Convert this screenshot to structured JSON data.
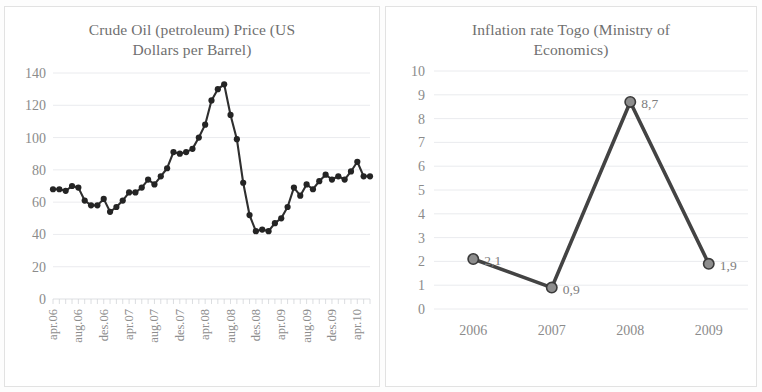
{
  "page": {
    "background": "#ffffff",
    "panel_border_color": "#e2e2e2"
  },
  "charts": [
    {
      "id": "crude-oil-price",
      "title_line1": "Crude Oil (petroleum) Price (US",
      "title_line2": "Dollars per Barrel)"
    },
    {
      "id": "inflation-togo",
      "title_line1": "Inflation rate Togo (Ministry of",
      "title_line2": "Economics)"
    }
  ],
  "chart_data": [
    {
      "type": "line",
      "id": "crude-oil-price",
      "title": "Crude Oil (petroleum) Price (US Dollars per Barrel)",
      "xlabel": "",
      "ylabel": "",
      "ylim": [
        0,
        140
      ],
      "yticks": [
        0,
        20,
        40,
        60,
        80,
        100,
        120,
        140
      ],
      "grid": true,
      "legend": "none",
      "markers": true,
      "line_color": "#2f2f2f",
      "marker_color": "#242424",
      "xtick_labels": [
        "apr.06",
        "aug.06",
        "des.06",
        "apr.07",
        "aug.07",
        "des.07",
        "apr.08",
        "aug.08",
        "des.08",
        "apr.09",
        "aug.09",
        "des.09",
        "apr.10"
      ],
      "xtick_label_rotation": -90,
      "x": [
        "apr.06",
        "may.06",
        "jun.06",
        "jul.06",
        "aug.06",
        "sep.06",
        "oct.06",
        "nov.06",
        "des.06",
        "jan.07",
        "feb.07",
        "mar.07",
        "apr.07",
        "may.07",
        "jun.07",
        "jul.07",
        "aug.07",
        "sep.07",
        "oct.07",
        "nov.07",
        "des.07",
        "jan.08",
        "feb.08",
        "mar.08",
        "apr.08",
        "may.08",
        "jun.08",
        "jul.08",
        "aug.08",
        "sep.08",
        "oct.08",
        "nov.08",
        "des.08",
        "jan.09",
        "feb.09",
        "mar.09",
        "apr.09",
        "may.09",
        "jun.09",
        "jul.09",
        "aug.09",
        "sep.09",
        "oct.09",
        "nov.09",
        "des.09",
        "jan.10",
        "feb.10",
        "mar.10",
        "apr.10"
      ],
      "values": [
        68,
        68,
        67,
        70,
        69,
        61,
        58,
        58,
        62,
        54,
        57,
        61,
        66,
        66,
        69,
        74,
        71,
        76,
        81,
        91,
        90,
        91,
        93,
        100,
        108,
        123,
        130,
        133,
        114,
        99,
        72,
        52,
        42,
        43,
        42,
        47,
        50,
        57,
        69,
        64,
        71,
        68,
        73,
        77,
        74,
        76,
        74,
        79,
        85,
        76,
        76
      ]
    },
    {
      "type": "line",
      "id": "inflation-togo",
      "title": "Inflation rate Togo (Ministry of Economics)",
      "xlabel": "",
      "ylabel": "",
      "ylim": [
        0,
        10
      ],
      "yticks": [
        0,
        1,
        2,
        3,
        4,
        5,
        6,
        7,
        8,
        9,
        10
      ],
      "grid": true,
      "legend": "none",
      "markers": true,
      "line_color": "#434343",
      "marker_color": "#8d8d8d",
      "categories": [
        "2006",
        "2007",
        "2008",
        "2009"
      ],
      "values": [
        2.1,
        0.9,
        8.7,
        1.9
      ],
      "data_labels": [
        "2,1",
        "0,9",
        "8,7",
        "1,9"
      ]
    }
  ]
}
